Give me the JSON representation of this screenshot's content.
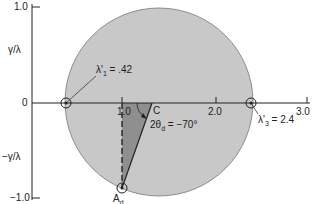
{
  "diagram": {
    "type": "mohr-circle",
    "y_axis": {
      "ticks": [
        "1.0",
        "0",
        "−1.0"
      ],
      "upper_label": "γ/λ",
      "lower_label": "−γ/λ"
    },
    "x_axis": {
      "ticks": [
        "1.0",
        "2.0",
        "3.0"
      ]
    },
    "points": {
      "lambda1": {
        "label": "λ'",
        "sub": "1",
        "value": " = .42"
      },
      "lambda3": {
        "label": "λ'",
        "sub": "3",
        "value": " = 2.4"
      },
      "center": {
        "label": "C"
      },
      "Ad": {
        "label": "A",
        "sub": "d"
      }
    },
    "angle": {
      "prefix": "2θ",
      "sub": "d",
      "value": " = −70°"
    },
    "colors": {
      "circle_fill": "#c8c8c8",
      "wedge_fill": "#8f8f8f",
      "line": "#222222"
    }
  }
}
